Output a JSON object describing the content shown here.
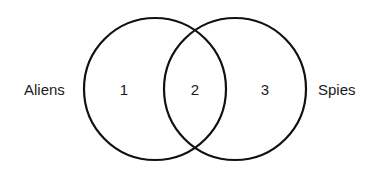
{
  "diagram": {
    "type": "venn",
    "stroke_color": "#111111",
    "background": "#ffffff",
    "sets": [
      {
        "name": "Aliens",
        "cx": 155,
        "cy": 89,
        "r": 71
      },
      {
        "name": "Spies",
        "cx": 235,
        "cy": 89,
        "r": 71
      }
    ],
    "labels": {
      "left": "Aliens",
      "right": "Spies"
    },
    "regions": [
      {
        "id": "aliens-only",
        "label": "1"
      },
      {
        "id": "aliens-and-spies",
        "label": "2"
      },
      {
        "id": "spies-only",
        "label": "3"
      }
    ]
  }
}
